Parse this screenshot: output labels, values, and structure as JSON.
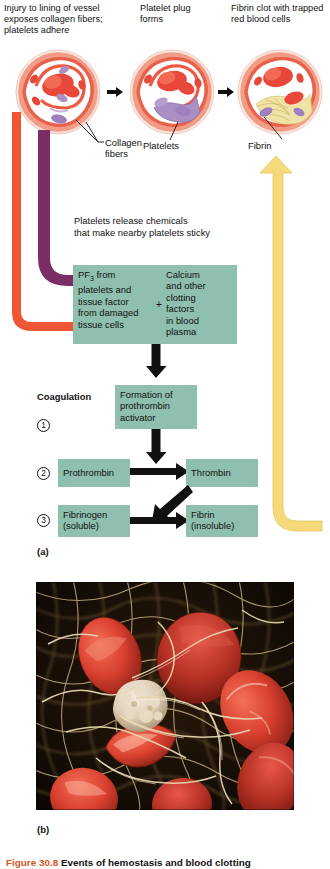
{
  "figure": {
    "caption_number": "Figure 30.8",
    "caption_text": "Events of hemostasis and blood clotting",
    "panel_a_label": "(a)",
    "panel_b_label": "(b)"
  },
  "steps": [
    {
      "id": "step-1",
      "text": "Injury to lining of vessel exposes collagen fibers; platelets adhere"
    },
    {
      "id": "step-2",
      "text": "Platelet plug forms"
    },
    {
      "id": "step-3",
      "text": "Fibrin clot with trapped red blood cells"
    }
  ],
  "callouts": {
    "collagen_fibers": "Collagen\nfibers",
    "platelets": "Platelets",
    "fibrin": "Fibrin"
  },
  "release_note": "Platelets release chemicals\nthat make nearby platelets sticky",
  "reactant_box": {
    "left": "PF3 from platelets and tissue factor from damaged tissue cells",
    "left_lines": [
      "PF",
      "3",
      " from",
      "platelets and",
      "tissue factor",
      "from damaged",
      "tissue cells"
    ],
    "plus": "+",
    "right_lines": [
      "Calcium",
      "and other",
      "clotting",
      "factors",
      "in blood",
      "plasma"
    ]
  },
  "coagulation": {
    "heading": "Coagulation",
    "steps": [
      {
        "number": "1",
        "boxes": [
          {
            "name": "prothrombin-activator",
            "lines": [
              "Formation of",
              "prothrombin",
              "activator"
            ]
          }
        ]
      },
      {
        "number": "2",
        "boxes": [
          {
            "name": "prothrombin",
            "lines": [
              "Prothrombin"
            ]
          },
          {
            "name": "thrombin",
            "lines": [
              "Thrombin"
            ]
          }
        ]
      },
      {
        "number": "3",
        "boxes": [
          {
            "name": "fibrinogen",
            "lines": [
              "Fibrinogen",
              "(soluble)"
            ]
          },
          {
            "name": "fibrin",
            "lines": [
              "Fibrin",
              "(insoluble)"
            ]
          }
        ]
      }
    ]
  },
  "micrograph": {
    "description": "Scanning electron micrograph of red blood cells trapped in a fibrin mesh"
  },
  "colors": {
    "box_green": "#8fbfae",
    "arrow_red": "#ef5634",
    "arrow_purple": "#7b2d68",
    "arrow_yellow": "#f5d97a",
    "arrow_black": "#111111",
    "caption_accent": "#d4541e",
    "rbc_red": "#e8483a",
    "platelet_purple": "#a98fc4"
  }
}
